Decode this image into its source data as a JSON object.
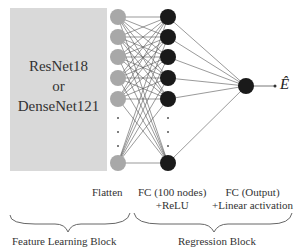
{
  "backbone": {
    "line1": "ResNet18",
    "line2": "or",
    "line3": "DenseNet121"
  },
  "layers": {
    "flatten": "Flatten",
    "fc_hidden": {
      "line1": "FC (100 nodes)",
      "line2": "+ReLU"
    },
    "fc_output": {
      "line1": "FC (Output)",
      "line2": "+Linear activation"
    }
  },
  "blocks": {
    "feature": "Feature Learning Block",
    "regression": "Regression Block"
  },
  "output_symbol": "Ê",
  "colors": {
    "box": "#d9d9d9",
    "flatten_node": "#a8a8a8",
    "hidden_node": "#1a1a1a",
    "edge": "#555555"
  }
}
